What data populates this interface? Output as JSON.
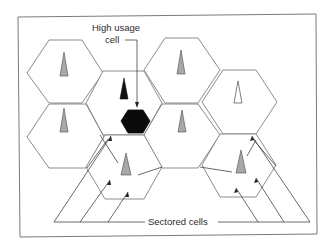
{
  "diagram": {
    "type": "cellular-network",
    "labels": {
      "high_usage_line1": "High usage",
      "high_usage_line2": "cell",
      "sectored": "Sectored cells"
    },
    "colors": {
      "hex_stroke": "#6e6e6e",
      "high_usage_fill": "#0a0a0a",
      "tower_gray": "#a8a8a8",
      "tower_black": "#111111",
      "tower_white": "#ffffff",
      "frame": "#7a7a7a"
    },
    "cells": [
      {
        "id": "top-left",
        "tower": "gray"
      },
      {
        "id": "upper-center",
        "tower": "black"
      },
      {
        "id": "top-center-right",
        "tower": "gray"
      },
      {
        "id": "right-upper",
        "tower": "white"
      },
      {
        "id": "left-lower",
        "tower": "gray"
      },
      {
        "id": "center",
        "tower": "gray"
      },
      {
        "id": "sectored-left",
        "tower": "gray",
        "sectored": true
      },
      {
        "id": "sectored-right",
        "tower": "gray",
        "sectored": true
      },
      {
        "id": "high-usage",
        "tower": "none",
        "high_usage": true
      }
    ]
  }
}
